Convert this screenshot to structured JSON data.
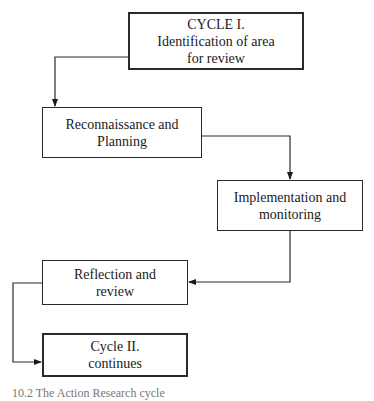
{
  "diagram": {
    "type": "flowchart",
    "title": "Action research cycle",
    "nodes": [
      {
        "id": "n1",
        "lines": [
          "CYCLE I.",
          "Identification of area",
          "for review"
        ]
      },
      {
        "id": "n2",
        "lines": [
          "Reconnaissance and",
          "Planning"
        ]
      },
      {
        "id": "n3",
        "lines": [
          "Implementation and",
          "monitoring"
        ]
      },
      {
        "id": "n4",
        "lines": [
          "Reflection and",
          "review"
        ]
      },
      {
        "id": "n5",
        "lines": [
          "Cycle II.",
          "continues"
        ]
      }
    ],
    "edges": [
      {
        "from": "n1",
        "to": "n2"
      },
      {
        "from": "n2",
        "to": "n3"
      },
      {
        "from": "n3",
        "to": "n4"
      },
      {
        "from": "n4",
        "to": "n5"
      }
    ],
    "caption": "10.2  The Action Research cycle"
  }
}
